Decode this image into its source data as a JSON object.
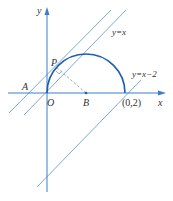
{
  "figure": {
    "axis_x_label": "x",
    "axis_y_label": "y",
    "origin_label": "O",
    "point_a_label": "A",
    "point_b_label": "B",
    "point_p_label": "P",
    "point_c_label": "(0,2)",
    "line1_label": "y=x",
    "line2_label": "y=x−2",
    "colors": {
      "axis": "#3a7fc8",
      "semicircle": "#1f5fa8",
      "lines": "#7aaad8",
      "dashed": "#8aa0b8"
    }
  }
}
